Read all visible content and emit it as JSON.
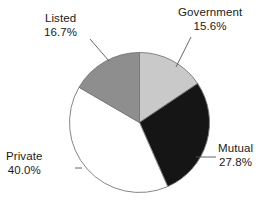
{
  "chart_data": {
    "type": "pie",
    "title": "",
    "subtitle": "",
    "xlabel": "",
    "ylabel": "",
    "legend_position": "none",
    "grid": false,
    "label_format": "name + percent",
    "start_angle_deg": 0,
    "direction": "clockwise",
    "categories": [
      "Government",
      "Mutual",
      "Private",
      "Listed"
    ],
    "values": [
      15.6,
      27.8,
      40.0,
      16.7
    ],
    "slices": [
      {
        "name": "Government",
        "value": 15.6,
        "value_label": "15.6%",
        "color": "#c9c9c9",
        "start_deg": 0,
        "end_deg": 56.16
      },
      {
        "name": "Mutual",
        "value": 27.8,
        "value_label": "27.8%",
        "color": "#151515",
        "start_deg": 56.16,
        "end_deg": 156.24
      },
      {
        "name": "Private",
        "value": 40.0,
        "value_label": "40.0%",
        "color": "#ffffff",
        "start_deg": 156.24,
        "end_deg": 300.24
      },
      {
        "name": "Listed",
        "value": 16.7,
        "value_label": "16.7%",
        "color": "#8e8e8e",
        "start_deg": 300.24,
        "end_deg": 360.0
      }
    ]
  },
  "labels": {
    "government": {
      "name": "Government",
      "value": "15.6%"
    },
    "mutual": {
      "name": "Mutual",
      "value": "27.8%"
    },
    "private": {
      "name": "Private",
      "value": "40.0%"
    },
    "listed": {
      "name": "Listed",
      "value": "16.7%"
    }
  },
  "colors": {
    "government": "#c9c9c9",
    "mutual": "#151515",
    "private": "#ffffff",
    "listed": "#8e8e8e",
    "outline": "#777777",
    "leader_line": "#555555",
    "text": "#1a1a1a",
    "background": "#ffffff"
  }
}
